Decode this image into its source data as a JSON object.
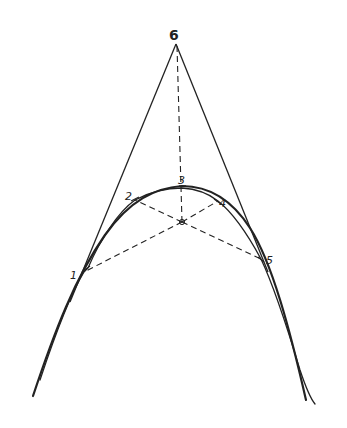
{
  "diagram": {
    "title": "",
    "colors": {
      "ink": "#222222",
      "background": "#ffffff"
    },
    "labels": [
      {
        "id": "p1",
        "text": "1"
      },
      {
        "id": "p2",
        "text": "2"
      },
      {
        "id": "p3",
        "text": "3"
      },
      {
        "id": "p4",
        "text": "4"
      },
      {
        "id": "p5",
        "text": "5"
      },
      {
        "id": "p6",
        "text": "6"
      }
    ],
    "points": {
      "apex_6": [
        176,
        42
      ],
      "center": [
        182,
        222
      ],
      "p1": [
        82,
        272
      ],
      "p2": [
        135,
        200
      ],
      "p3": [
        182,
        188
      ],
      "p4": [
        218,
        201
      ],
      "p5": [
        261,
        259
      ]
    },
    "elements": [
      "tangent line from 6 to lower left",
      "tangent line from 6 to lower right",
      "dashed line from 6 to center",
      "dashed lines from center to points 1, 2, 4, 5",
      "smooth curve through points",
      "polygonal approximation through points 1-2-3-4-5"
    ]
  }
}
